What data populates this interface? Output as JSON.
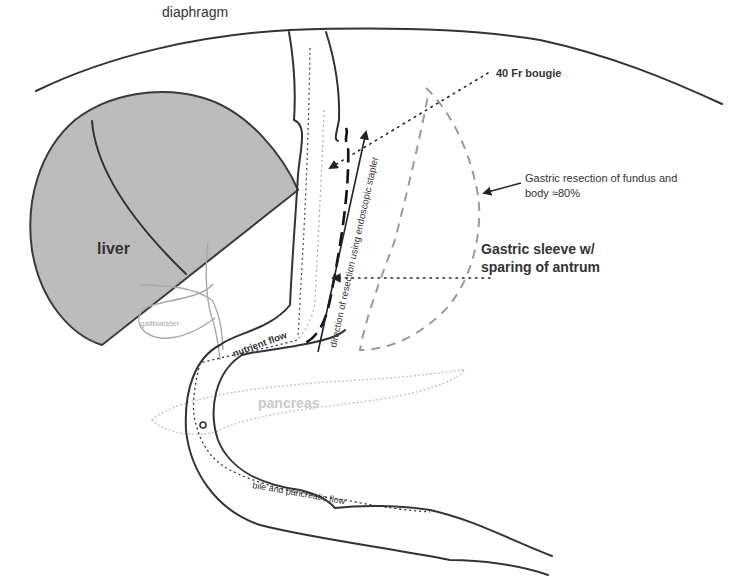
{
  "diagram": {
    "labels": {
      "diaphragm": "diaphragm",
      "liver": "liver",
      "gallbladder": "gallbladder",
      "bougie": "40 Fr bougie",
      "resection_line1": "Gastric resection of fundus and",
      "resection_line2": "body ≈80%",
      "sleeve_line1": "Gastric sleeve w/",
      "sleeve_line2": "sparing of antrum",
      "stapler_direction": "direction of resection using endoscopic stapler",
      "nutrient_flow": "nutrient flow",
      "pancreas": "pancreas",
      "bile_flow": "bile and pancreatic flow"
    },
    "colors": {
      "outline": "#333333",
      "liver_fill": "#b9b9b9",
      "resected_dash": "#9a9a9a",
      "pancreas": "#c8c8c8",
      "gallbladder": "#a8a8a8",
      "background": "#ffffff"
    }
  }
}
